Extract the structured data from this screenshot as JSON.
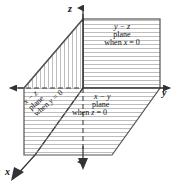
{
  "figure": {
    "background_color": "#ffffff",
    "line_color": "#555555",
    "hatch_color": "#b8b8b8",
    "text_color": "#111111"
  },
  "axes": [
    {
      "id": "z",
      "label": "z",
      "direction": "up",
      "arrow": "up"
    },
    {
      "id": "y",
      "label": "y",
      "direction": "right",
      "arrow": "right"
    },
    {
      "id": "x",
      "label": "x",
      "direction": "down-left",
      "arrow": "down-left"
    },
    {
      "id": "y-negative",
      "label": "",
      "direction": "left",
      "arrow": "left"
    },
    {
      "id": "z-negative",
      "label": "",
      "direction": "down",
      "arrow": "down"
    }
  ],
  "planes": [
    {
      "id": "yz",
      "name": "y - z plane",
      "line1": "y − z",
      "line2": "plane",
      "line3_prefix": "when ",
      "line3_var": "x",
      "line3_suffix": " = 0",
      "condition": "x = 0",
      "hatch": "horizontal",
      "position": "upper-right"
    },
    {
      "id": "xy",
      "name": "x - y plane",
      "line1": "x − y",
      "line2": "plane",
      "line3_prefix": "when ",
      "line3_var": "z",
      "line3_suffix": " = 0",
      "condition": "z = 0",
      "hatch": "horizontal",
      "position": "lower-right"
    },
    {
      "id": "xz",
      "name": "x - z plane",
      "line1": "x − z",
      "line2": "plane",
      "line3_prefix": "when ",
      "line3_var": "y",
      "line3_suffix": " = 0",
      "condition": "y = 0",
      "hatch": "vertical",
      "position": "left-rotated"
    }
  ]
}
